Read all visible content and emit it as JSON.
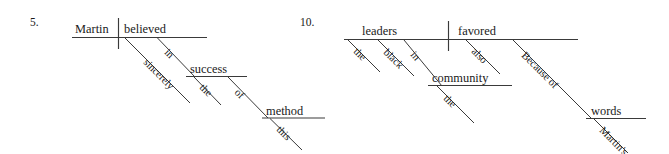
{
  "page": {
    "background_color": "#ffffff",
    "ink_color": "#3a3a3a",
    "text_color": "#1a1a1a",
    "width": 669,
    "height": 154,
    "content_type": "reed-kellogg-sentence-diagrams"
  },
  "diagrams": [
    {
      "number": "5.",
      "sentence": "Martin sincerely believed in the success of this method",
      "subject": "Martin",
      "verb": "believed",
      "words": {
        "subject": "Martin",
        "verb": "believed",
        "verb_modifier": "sincerely",
        "preposition_1": "in",
        "object_1": "success",
        "object_1_article": "the",
        "preposition_2": "of",
        "object_2": "method",
        "object_2_determiner": "this"
      },
      "labels": [
        {
          "text": "Martin",
          "role": "subject",
          "style": "main"
        },
        {
          "text": "believed",
          "role": "verb",
          "style": "main"
        },
        {
          "text": "sincerely",
          "role": "adverb",
          "style": "modifier"
        },
        {
          "text": "in",
          "role": "preposition",
          "style": "modifier"
        },
        {
          "text": "success",
          "role": "object-of-preposition",
          "style": "main"
        },
        {
          "text": "the",
          "role": "article",
          "style": "modifier"
        },
        {
          "text": "of",
          "role": "preposition",
          "style": "modifier"
        },
        {
          "text": "method",
          "role": "object-of-preposition",
          "style": "main"
        },
        {
          "text": "this",
          "role": "determiner",
          "style": "modifier"
        }
      ]
    },
    {
      "number": "10.",
      "sentence": "Because of Martin's words the black leaders in the community also favored",
      "subject": "leaders",
      "verb": "favored",
      "words": {
        "subject": "leaders",
        "verb": "favored",
        "subject_article": "the",
        "subject_adjective": "black",
        "preposition_1": "in",
        "object_1": "community",
        "object_1_article": "the",
        "verb_modifier": "also",
        "preposition_2": "Because of",
        "object_2": "words",
        "object_2_possessive": "Martin's"
      },
      "labels": [
        {
          "text": "leaders",
          "role": "subject",
          "style": "main"
        },
        {
          "text": "favored",
          "role": "verb",
          "style": "main"
        },
        {
          "text": "the",
          "role": "article",
          "style": "modifier"
        },
        {
          "text": "black",
          "role": "adjective",
          "style": "modifier"
        },
        {
          "text": "in",
          "role": "preposition",
          "style": "modifier"
        },
        {
          "text": "community",
          "role": "object-of-preposition",
          "style": "main"
        },
        {
          "text": "the",
          "role": "article",
          "style": "modifier"
        },
        {
          "text": "also",
          "role": "adverb",
          "style": "modifier"
        },
        {
          "text": "Because of",
          "role": "preposition",
          "style": "modifier"
        },
        {
          "text": "words",
          "role": "object-of-preposition",
          "style": "main"
        },
        {
          "text": "Martin's",
          "role": "possessive",
          "style": "modifier"
        }
      ]
    }
  ]
}
